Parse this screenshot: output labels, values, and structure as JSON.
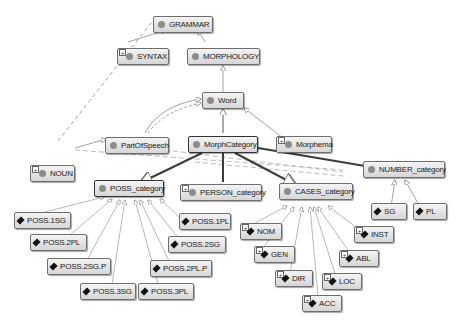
{
  "diagram": {
    "nodes": {
      "grammar": {
        "label": "GRAMMAR",
        "kind": "class"
      },
      "syntax": {
        "label": "SYNTAX",
        "kind": "class"
      },
      "morphology": {
        "label": "MORPHOLOGY",
        "kind": "class"
      },
      "word": {
        "label": "Word",
        "kind": "class"
      },
      "part_of_speech": {
        "label": "PartOfSpeech",
        "kind": "class"
      },
      "morph_category": {
        "label": "MorphCategory",
        "kind": "class"
      },
      "morphema": {
        "label": "Morphema",
        "kind": "class"
      },
      "noun": {
        "label": "NOUN",
        "kind": "class"
      },
      "number_category": {
        "label": "NUMBER_category",
        "kind": "class"
      },
      "poss_category": {
        "label": "POSS_category",
        "kind": "class"
      },
      "person_category": {
        "label": "PERSON_category",
        "kind": "class"
      },
      "cases_category": {
        "label": "CASES_category",
        "kind": "class"
      },
      "sg": {
        "label": "SG",
        "kind": "individual"
      },
      "pl": {
        "label": "PL",
        "kind": "individual"
      },
      "poss_1sg": {
        "label": "POSS.1SG",
        "kind": "individual"
      },
      "poss_2pl": {
        "label": "POSS.2PL",
        "kind": "individual"
      },
      "poss_2sg_p": {
        "label": "POSS.2SG.P",
        "kind": "individual"
      },
      "poss_3sg": {
        "label": "POSS.3SG",
        "kind": "individual"
      },
      "poss_3pl": {
        "label": "POSS.3PL",
        "kind": "individual"
      },
      "poss_2pl_p": {
        "label": "POSS.2PL.P",
        "kind": "individual"
      },
      "poss_2sg": {
        "label": "POSS.2SG",
        "kind": "individual"
      },
      "poss_1pl": {
        "label": "POSS.1PL",
        "kind": "individual"
      },
      "nom": {
        "label": "NOM",
        "kind": "individual"
      },
      "gen": {
        "label": "GEN",
        "kind": "individual"
      },
      "dir": {
        "label": "DIR",
        "kind": "individual"
      },
      "acc": {
        "label": "ACC",
        "kind": "individual"
      },
      "loc": {
        "label": "LOC",
        "kind": "individual"
      },
      "abl": {
        "label": "ABL",
        "kind": "individual"
      },
      "inst": {
        "label": "INST",
        "kind": "individual"
      }
    },
    "edges": [
      {
        "from": "syntax",
        "to": "grammar",
        "style": "solid"
      },
      {
        "from": "morphology",
        "to": "grammar",
        "style": "solid"
      },
      {
        "from": "word",
        "to": "morphology",
        "style": "solid"
      },
      {
        "from": "morph_category",
        "to": "word",
        "style": "solid"
      },
      {
        "from": "morphema",
        "to": "word",
        "style": "solid"
      },
      {
        "from": "part_of_speech",
        "to": "word",
        "style": "solid"
      },
      {
        "from": "part_of_speech",
        "to": "word",
        "style": "dashed"
      },
      {
        "from": "noun",
        "to": "part_of_speech",
        "style": "solid"
      },
      {
        "from": "noun",
        "to": "syntax",
        "style": "dashed"
      },
      {
        "from": "noun",
        "to": "number_category",
        "style": "dashed"
      },
      {
        "from": "poss_category",
        "to": "morph_category",
        "style": "bold"
      },
      {
        "from": "person_category",
        "to": "morph_category",
        "style": "bold"
      },
      {
        "from": "cases_category",
        "to": "morph_category",
        "style": "bold"
      },
      {
        "from": "number_category",
        "to": "morph_category",
        "style": "bold"
      },
      {
        "from": "sg",
        "to": "number_category",
        "style": "solid"
      },
      {
        "from": "pl",
        "to": "number_category",
        "style": "solid"
      }
    ]
  }
}
